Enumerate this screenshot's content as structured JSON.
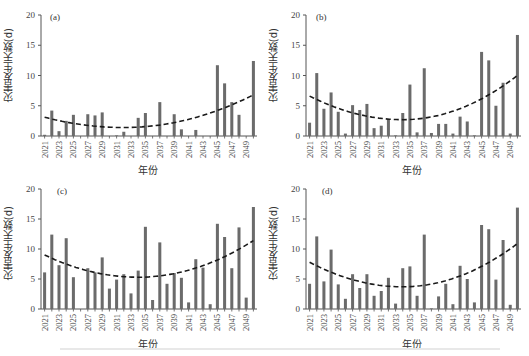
{
  "figure": {
    "ylabel": "灾害发生天数(d)",
    "xlabel": "年份",
    "bar_color": "#6b6b6b",
    "trend_color": "#1a1a1a"
  },
  "chart_data": [
    {
      "type": "bar",
      "panel": "(a)",
      "title": "(a)",
      "xlabel": "年份",
      "ylabel": "灾害发生天数(d)",
      "ylim": [
        0,
        20
      ],
      "yticks": [
        0,
        5,
        10,
        15,
        20
      ],
      "xtick_labels": [
        "2021",
        "2023",
        "2025",
        "2027",
        "2029",
        "2031",
        "2033",
        "2035",
        "2037",
        "2039",
        "2041",
        "2043",
        "2045",
        "2047",
        "2049"
      ],
      "categories": [
        2021,
        2022,
        2023,
        2024,
        2025,
        2026,
        2027,
        2028,
        2029,
        2030,
        2031,
        2032,
        2033,
        2034,
        2035,
        2036,
        2037,
        2038,
        2039,
        2040,
        2041,
        2042,
        2043,
        2044,
        2045,
        2046,
        2047,
        2048,
        2049,
        2050
      ],
      "values": [
        0.2,
        4.2,
        0.8,
        2.5,
        3.5,
        0,
        3.6,
        3.4,
        3.9,
        0,
        0.1,
        0.7,
        0,
        3.0,
        3.8,
        0,
        5.6,
        0,
        3.6,
        1.1,
        0,
        1.0,
        0,
        0,
        11.7,
        8.7,
        5.6,
        3.5,
        0,
        12.4
      ],
      "trend": {
        "type": "quadratic",
        "style": "dashed",
        "start": 3.1,
        "min": 1.4,
        "min_at": 2032,
        "end": 6.8
      },
      "grid": false
    },
    {
      "type": "bar",
      "panel": "(b)",
      "title": "(b)",
      "xlabel": "年份",
      "ylabel": "灾害发生天数(d)",
      "ylim": [
        0,
        20
      ],
      "yticks": [
        0,
        5,
        10,
        15,
        20
      ],
      "xtick_labels": [
        "2021",
        "2023",
        "2025",
        "2027",
        "2029",
        "2031",
        "2033",
        "2035",
        "2037",
        "2039",
        "2041",
        "2043",
        "2045",
        "2047",
        "2049"
      ],
      "categories": [
        2021,
        2022,
        2023,
        2024,
        2025,
        2026,
        2027,
        2028,
        2029,
        2030,
        2031,
        2032,
        2033,
        2034,
        2035,
        2036,
        2037,
        2038,
        2039,
        2040,
        2041,
        2042,
        2043,
        2044,
        2045,
        2046,
        2047,
        2048,
        2049,
        2050
      ],
      "values": [
        2.2,
        10.4,
        4.5,
        7.2,
        4.0,
        0.4,
        5.1,
        4.3,
        5.3,
        1.3,
        1.7,
        2.8,
        0.1,
        3.8,
        8.5,
        0.6,
        11.2,
        0.5,
        2.0,
        2.0,
        0.4,
        3.2,
        2.4,
        0.1,
        13.9,
        12.5,
        5.0,
        8.8,
        0.4,
        16.7
      ],
      "trend": {
        "type": "quadratic",
        "style": "dashed",
        "start": 6.6,
        "min": 2.7,
        "min_at": 2034,
        "end": 10.0
      },
      "grid": false
    },
    {
      "type": "bar",
      "panel": "(c)",
      "title": "(c)",
      "xlabel": "年份",
      "ylabel": "灾害发生天数(d)",
      "ylim": [
        0,
        20
      ],
      "yticks": [
        0,
        5,
        10,
        15,
        20
      ],
      "xtick_labels": [
        "2021",
        "2023",
        "2025",
        "2027",
        "2029",
        "2031",
        "2033",
        "2035",
        "2037",
        "2039",
        "2041",
        "2043",
        "2045",
        "2047",
        "2049"
      ],
      "categories": [
        2021,
        2022,
        2023,
        2024,
        2025,
        2026,
        2027,
        2028,
        2029,
        2030,
        2031,
        2032,
        2033,
        2034,
        2035,
        2036,
        2037,
        2038,
        2039,
        2040,
        2041,
        2042,
        2043,
        2044,
        2045,
        2046,
        2047,
        2048,
        2049,
        2050
      ],
      "values": [
        6.1,
        12.4,
        7.3,
        11.8,
        5.3,
        0,
        6.8,
        6.1,
        8.6,
        3.4,
        4.9,
        5.8,
        2.6,
        6.4,
        13.7,
        1.5,
        11.1,
        4.2,
        6.0,
        5.2,
        1.1,
        8.3,
        6.9,
        0.8,
        14.2,
        12.0,
        6.8,
        13.6,
        1.9,
        17.0
      ],
      "trend": {
        "type": "quadratic",
        "style": "dashed",
        "start": 9.0,
        "min": 5.3,
        "min_at": 2034,
        "end": 11.4
      },
      "grid": false
    },
    {
      "type": "bar",
      "panel": "(d)",
      "title": "(d)",
      "xlabel": "年份",
      "ylabel": "灾害发生天数(d)",
      "ylim": [
        0,
        20
      ],
      "yticks": [
        0,
        5,
        10,
        15,
        20
      ],
      "xtick_labels": [
        "2021",
        "2023",
        "2025",
        "2027",
        "2029",
        "2031",
        "2033",
        "2035",
        "2037",
        "2039",
        "2041",
        "2043",
        "2045",
        "2047",
        "2049"
      ],
      "categories": [
        2021,
        2022,
        2023,
        2024,
        2025,
        2026,
        2027,
        2028,
        2029,
        2030,
        2031,
        2032,
        2033,
        2034,
        2035,
        2036,
        2037,
        2038,
        2039,
        2040,
        2041,
        2042,
        2043,
        2044,
        2045,
        2046,
        2047,
        2048,
        2049,
        2050
      ],
      "values": [
        4.2,
        12.1,
        4.6,
        9.9,
        4.1,
        1.7,
        5.8,
        3.5,
        5.8,
        2.2,
        3.0,
        5.2,
        0.9,
        6.8,
        7.1,
        2.2,
        12.4,
        0.1,
        2.1,
        4.2,
        0.8,
        7.2,
        5.0,
        1.1,
        14.0,
        13.3,
        4.9,
        11.5,
        0.7,
        16.9
      ],
      "trend": {
        "type": "quadratic",
        "style": "dashed",
        "start": 7.8,
        "min": 3.7,
        "min_at": 2034,
        "end": 10.9
      },
      "grid": false
    }
  ]
}
